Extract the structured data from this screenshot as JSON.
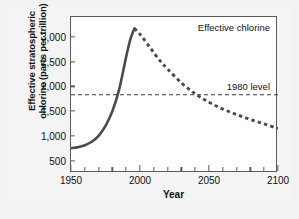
{
  "figure": {
    "background_color": "#f2f2f2",
    "plot_background_color": "#ffffff",
    "frame_color": "#5b5b5b"
  },
  "chart_data": {
    "type": "line",
    "title": "",
    "xlabel": "Year",
    "ylabel_line1": "Effective stratospheric",
    "ylabel_line2": "chlorine (parts per trillion)",
    "xlim": [
      1950,
      2100
    ],
    "ylim": [
      250,
      3400
    ],
    "grid": false,
    "legend_position": "none",
    "x_major_ticks": [
      1950,
      2000,
      2050,
      2100
    ],
    "x_major_tick_labels": [
      "1950",
      "2000",
      "2050",
      "2100"
    ],
    "x_minor_tick_interval": 10,
    "y_ticks": [
      500,
      1000,
      1500,
      2000,
      2500,
      3000
    ],
    "y_tick_labels": [
      "500",
      "1,000",
      "1,500",
      "2,000",
      "2,500",
      "3,000"
    ],
    "series": [
      {
        "name": "Effective chlorine",
        "annotation": "Effective chlorine",
        "color": "#4a4a4a",
        "style_observed": "solid",
        "style_projected": "dashed",
        "split_year": 1996,
        "x": [
          1950,
          1955,
          1960,
          1965,
          1970,
          1975,
          1980,
          1985,
          1990,
          1993,
          1996,
          2000,
          2005,
          2010,
          2015,
          2020,
          2030,
          2040,
          2050,
          2060,
          2070,
          2080,
          2090,
          2100
        ],
        "values": [
          750,
          770,
          810,
          880,
          1000,
          1200,
          1500,
          1950,
          2600,
          2950,
          3170,
          3050,
          2870,
          2680,
          2500,
          2350,
          2070,
          1850,
          1680,
          1540,
          1430,
          1330,
          1240,
          1150
        ]
      }
    ],
    "reference_line": {
      "label": "1980 level",
      "value": 1830,
      "style": "dashed",
      "color": "#3a3a3a"
    }
  }
}
